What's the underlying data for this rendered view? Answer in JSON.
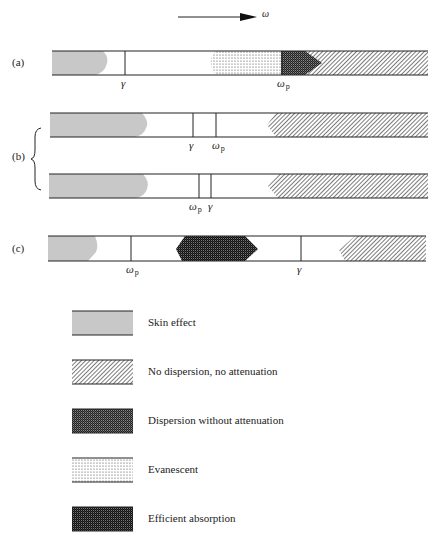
{
  "axis": {
    "label": "ω",
    "direction": "increasing frequency"
  },
  "panels": {
    "a": {
      "label": "(a)",
      "markers": [
        {
          "symbol": "γ",
          "sub": ""
        },
        {
          "symbol": "ω",
          "sub": "p"
        }
      ]
    },
    "b": {
      "label": "(b)",
      "rows": [
        {
          "markers": [
            {
              "symbol": "γ",
              "sub": ""
            },
            {
              "symbol": "ω",
              "sub": "p"
            }
          ]
        },
        {
          "markers": [
            {
              "symbol": "ω",
              "sub": "p"
            },
            {
              "symbol": "γ",
              "sub": ""
            }
          ]
        }
      ]
    },
    "c": {
      "label": "(c)",
      "markers": [
        {
          "symbol": "ω",
          "sub": "p"
        },
        {
          "symbol": "γ",
          "sub": ""
        }
      ]
    }
  },
  "legend": [
    {
      "key": "skin",
      "label": "Skin effect"
    },
    {
      "key": "nodisp",
      "label": "No dispersion, no attenuation"
    },
    {
      "key": "disp",
      "label": "Dispersion without attenuation"
    },
    {
      "key": "evan",
      "label": "Evanescent"
    },
    {
      "key": "absorb",
      "label": "Efficient absorption"
    }
  ],
  "colors": {
    "ink": "#222222",
    "skin": "#c8c8c8",
    "background": "#ffffff"
  }
}
